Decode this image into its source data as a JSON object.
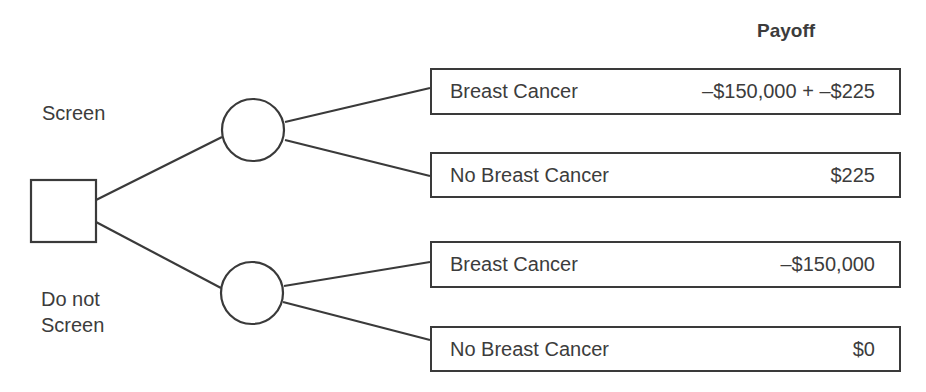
{
  "header": {
    "payoff_label": "Payoff"
  },
  "decision_node": {
    "shape": "square"
  },
  "branches": [
    {
      "label": "Screen",
      "outcomes": [
        {
          "label": "Breast Cancer",
          "payoff": "–$150,000 + –$225"
        },
        {
          "label": "No Breast Cancer",
          "payoff": "$225"
        }
      ]
    },
    {
      "label_line1": "Do not",
      "label_line2": "Screen",
      "outcomes": [
        {
          "label": "Breast Cancer",
          "payoff": "–$150,000"
        },
        {
          "label": "No Breast Cancer",
          "payoff": "$0"
        }
      ]
    }
  ],
  "colors": {
    "stroke": "#3a3a3a",
    "text": "#3c3c3c",
    "background": "#ffffff"
  }
}
